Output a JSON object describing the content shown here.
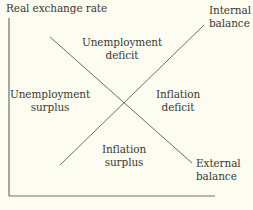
{
  "diagram": {
    "title": "Real exchange rate",
    "colors": {
      "background": "#fdfcf0",
      "line": "#6f6f6a",
      "text": "#3a3a36"
    },
    "axes": {
      "y_axis": {
        "x": 9,
        "y1": 18,
        "y2": 196
      },
      "x_axis": {
        "y": 196,
        "x1": 9,
        "x2": 215
      }
    },
    "curves": [
      {
        "name": "Internal balance",
        "line1": "Internal",
        "line2": "balance",
        "from": [
          60,
          165
        ],
        "to": [
          204,
          25
        ]
      },
      {
        "name": "External balance",
        "line1": "External",
        "line2": "balance",
        "from": [
          50,
          37
        ],
        "to": [
          192,
          163
        ]
      }
    ],
    "regions": {
      "top": {
        "line1": "Unemployment",
        "line2": "deficit"
      },
      "left": {
        "line1": "Unemployment",
        "line2": "surplus"
      },
      "right": {
        "line1": "Inflation",
        "line2": "deficit"
      },
      "bottom": {
        "line1": "Inflation",
        "line2": "surplus"
      }
    }
  }
}
